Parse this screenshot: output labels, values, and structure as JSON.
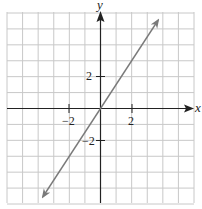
{
  "chart_data": {
    "type": "line",
    "title": "",
    "xlabel": "x",
    "ylabel": "y",
    "xlim": [
      -6,
      6
    ],
    "ylim": [
      -6,
      6
    ],
    "grid": true,
    "grid_step": 1,
    "x_ticks": [
      {
        "value": -2,
        "label": "−2"
      },
      {
        "value": 2,
        "label": "2"
      }
    ],
    "y_ticks": [
      {
        "value": 2,
        "label": "2"
      },
      {
        "value": -2,
        "label": "−2"
      }
    ],
    "series": [
      {
        "name": "y = 1.5x",
        "equation": "y = (3/2)x",
        "slope": 1.5,
        "intercept": 0,
        "x": [
          -3.7,
          3.7
        ],
        "y": [
          -5.55,
          5.55
        ],
        "arrows_both_ends": true,
        "color": "#7a7a7a"
      }
    ]
  },
  "labels": {
    "x_axis": "x",
    "y_axis": "y",
    "x_tick_neg2": "−2",
    "x_tick_pos2": "2",
    "y_tick_pos2": "2",
    "y_tick_neg2": "−2"
  },
  "colors": {
    "grid": "#c8c8c8",
    "axis": "#222222",
    "line": "#7a7a7a"
  }
}
